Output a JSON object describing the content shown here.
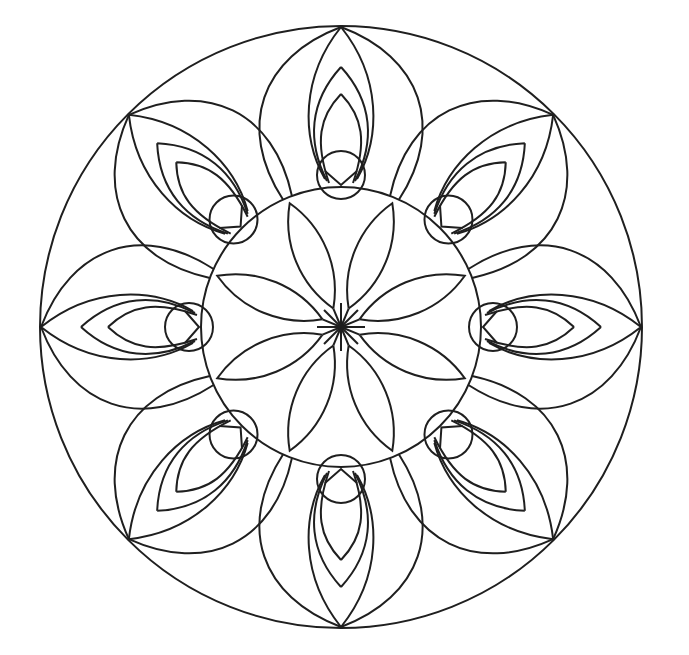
{
  "title": "Mandala coloring page",
  "style": {
    "stroke": "#1f1f1f",
    "background": "#ffffff"
  },
  "mandala": {
    "center": [
      341,
      327
    ],
    "outer_radius": 301,
    "inner_radius": 140,
    "small_circle_radius": 24,
    "small_circle_distance": 152,
    "symmetry": 8,
    "outer_petals": 8,
    "center_flower_petals": 8
  }
}
